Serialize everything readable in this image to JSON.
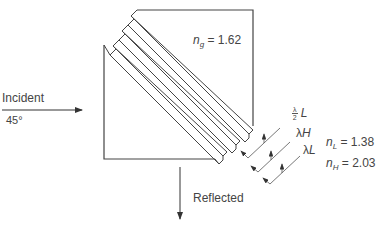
{
  "diagram": {
    "type": "thin-film beam-splitter cube (multilayer coating on diagonal)",
    "incident": {
      "label": "Incident",
      "angle": "45°"
    },
    "reflected": {
      "label": "Reflected"
    },
    "glass": {
      "symbol": "n",
      "subscript": "g",
      "value": "= 1.62"
    },
    "low_index": {
      "symbol": "n",
      "subscript": "L",
      "value": "= 1.38"
    },
    "high_index": {
      "symbol": "n",
      "subscript": "H",
      "value": "= 2.03"
    },
    "layer_labels": [
      {
        "frac_num": "λ",
        "frac_den": "2",
        "suffix": "L"
      },
      {
        "prefix": "λ",
        "suffix": "H"
      },
      {
        "prefix": "λ",
        "suffix": "L"
      }
    ],
    "colors": {
      "line": "#444444",
      "background": "#ffffff"
    }
  }
}
